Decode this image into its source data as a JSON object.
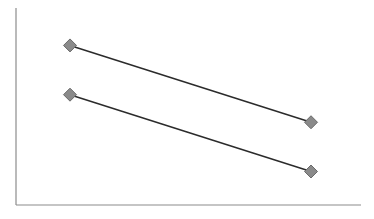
{
  "chart_data": {
    "type": "line",
    "title": "",
    "xlabel": "",
    "ylabel": "",
    "categories": [
      "1",
      "2"
    ],
    "series": [
      {
        "name": "Series 1",
        "values": [
          81,
          42
        ]
      },
      {
        "name": "Series 2",
        "values": [
          56,
          17
        ]
      }
    ],
    "ylim": [
      0,
      100
    ],
    "grid": false,
    "legend": "none",
    "markers": "diamond"
  },
  "style": {
    "axis_color": "#8c8c8c",
    "line_color": "#2b2b2b",
    "marker_fill": "#8a8a8a",
    "marker_stroke": "#6a6a6a"
  },
  "layout": {
    "plot_left": 16,
    "plot_right": 361,
    "plot_top": 8,
    "plot_bottom": 205,
    "x_positions": [
      70,
      311
    ]
  }
}
